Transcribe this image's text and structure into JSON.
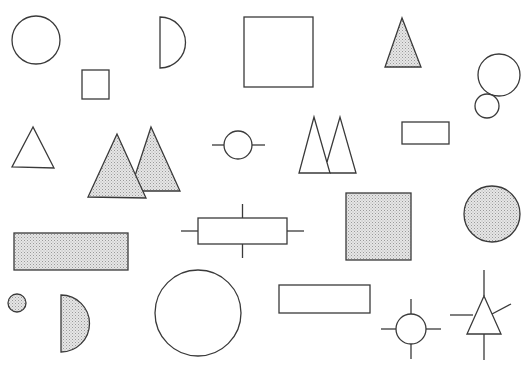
{
  "colors": {
    "background": "#ffffff",
    "stroke": "#3a3a3a",
    "shade_base": "#e6e6e6",
    "shade_dot": "#9a9a9a"
  },
  "shapes": [
    {
      "id": "circle-outline-large-top-left",
      "type": "circle",
      "style": "outline",
      "cx": 36,
      "cy": 40,
      "r": 24
    },
    {
      "id": "square-outline-small",
      "type": "rect",
      "style": "outline",
      "x": 82,
      "y": 70,
      "w": 27,
      "h": 29
    },
    {
      "id": "half-circle-outline",
      "type": "half-circle",
      "style": "outline",
      "x": 160,
      "y1": 17,
      "y2": 68
    },
    {
      "id": "square-outline-large",
      "type": "rect",
      "style": "outline",
      "x": 244,
      "y": 17,
      "w": 69,
      "h": 70
    },
    {
      "id": "triangle-shaded-top",
      "type": "triangle",
      "style": "shaded",
      "points": [
        [
          402,
          18
        ],
        [
          385,
          67
        ],
        [
          421,
          67
        ]
      ]
    },
    {
      "id": "circle-pair-large",
      "type": "circle",
      "style": "outline",
      "cx": 499,
      "cy": 75,
      "r": 21
    },
    {
      "id": "circle-pair-small",
      "type": "circle",
      "style": "outline",
      "cx": 487,
      "cy": 106,
      "r": 12
    },
    {
      "id": "triangle-outline-left",
      "type": "triangle",
      "style": "outline",
      "points": [
        [
          33,
          127
        ],
        [
          12,
          167
        ],
        [
          54,
          168
        ]
      ]
    },
    {
      "id": "triangle-shaded-pair-back",
      "type": "triangle",
      "style": "shaded",
      "points": [
        [
          151,
          127
        ],
        [
          130,
          191
        ],
        [
          180,
          191
        ]
      ]
    },
    {
      "id": "triangle-shaded-pair-front",
      "type": "triangle",
      "style": "shaded",
      "points": [
        [
          117,
          134
        ],
        [
          88,
          197
        ],
        [
          146,
          198
        ]
      ]
    },
    {
      "id": "circle-with-horizontal-leads",
      "type": "circle-leads-h",
      "style": "outline",
      "cx": 238,
      "cy": 145,
      "r": 14,
      "lead_x1": 212,
      "lead_x2": 265
    },
    {
      "id": "triangle-outline-pair-first",
      "type": "triangle",
      "style": "outline",
      "points": [
        [
          314,
          117
        ],
        [
          299,
          173
        ],
        [
          330,
          173
        ]
      ]
    },
    {
      "id": "triangle-outline-pair-second",
      "type": "triangle",
      "style": "outline",
      "points": [
        [
          340,
          117
        ],
        [
          327,
          162
        ],
        [
          330,
          173
        ],
        [
          356,
          173
        ]
      ]
    },
    {
      "id": "rect-outline-small-right",
      "type": "rect",
      "style": "outline",
      "x": 402,
      "y": 122,
      "w": 47,
      "h": 22
    },
    {
      "id": "rect-shaded-wide",
      "type": "rect",
      "style": "shaded",
      "x": 14,
      "y": 233,
      "w": 114,
      "h": 37
    },
    {
      "id": "rect-with-four-leads",
      "type": "rect-leads",
      "style": "outline",
      "x": 198,
      "y": 218,
      "w": 89,
      "h": 26,
      "lead_len_v": 14,
      "lead_len_h": 17
    },
    {
      "id": "square-shaded",
      "type": "rect",
      "style": "shaded",
      "x": 346,
      "y": 193,
      "w": 65,
      "h": 67
    },
    {
      "id": "circle-shaded-right",
      "type": "circle",
      "style": "shaded",
      "cx": 492,
      "cy": 214,
      "r": 28
    },
    {
      "id": "circle-shaded-tiny",
      "type": "circle",
      "style": "shaded",
      "cx": 17,
      "cy": 303,
      "r": 9
    },
    {
      "id": "half-circle-shaded",
      "type": "half-circle",
      "style": "shaded",
      "x": 61,
      "y1": 295,
      "y2": 352
    },
    {
      "id": "circle-outline-large-bottom",
      "type": "circle",
      "style": "outline",
      "cx": 198,
      "cy": 313,
      "r": 43
    },
    {
      "id": "rect-outline-bottom",
      "type": "rect",
      "style": "outline",
      "x": 279,
      "y": 285,
      "w": 91,
      "h": 28
    },
    {
      "id": "circle-with-four-leads",
      "type": "circle-leads-4",
      "style": "outline",
      "cx": 411,
      "cy": 329,
      "r": 15,
      "lead_len": 15
    },
    {
      "id": "triangle-with-leads",
      "type": "triangle-leads",
      "style": "outline",
      "points": [
        [
          484,
          296
        ],
        [
          467,
          334
        ],
        [
          501,
          334
        ]
      ],
      "leads": [
        [
          484,
          270,
          484,
          296
        ],
        [
          484,
          334,
          484,
          360
        ],
        [
          450,
          315,
          473,
          315
        ],
        [
          492,
          314,
          511,
          304
        ]
      ]
    }
  ]
}
